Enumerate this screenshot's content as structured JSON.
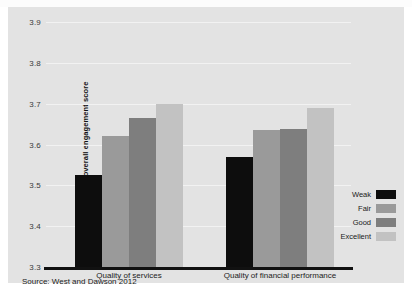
{
  "chart_data": {
    "type": "bar",
    "title": "",
    "xlabel": "",
    "ylabel": "Average overall engagement score",
    "ylim": [
      3.3,
      3.9
    ],
    "ytick_values": [
      3.3,
      3.4,
      3.5,
      3.6,
      3.7,
      3.8,
      3.9
    ],
    "ytick_labels": [
      "3.3",
      "3.4",
      "3.5",
      "3.6",
      "3.7",
      "3.8",
      "3.9"
    ],
    "grid": true,
    "legend_position": "right",
    "categories": [
      "Quality of services",
      "Quality of financial performance"
    ],
    "series": [
      {
        "name": "Weak",
        "color": "#0d0d0d",
        "values": [
          3.525,
          3.57
        ]
      },
      {
        "name": "Fair",
        "color": "#9a9a9a",
        "values": [
          3.62,
          3.635
        ]
      },
      {
        "name": "Good",
        "color": "#7e7e7e",
        "values": [
          3.665,
          3.638
        ]
      },
      {
        "name": "Excellent",
        "color": "#c2c2c2",
        "values": [
          3.7,
          3.69
        ]
      }
    ],
    "source_note": "Source: West and Dawson 2012",
    "colors": {
      "panel_background": "#e3e3e3",
      "gridline": "#f2f2f2",
      "axis": "#111111",
      "text": "#1a1a1a"
    }
  }
}
